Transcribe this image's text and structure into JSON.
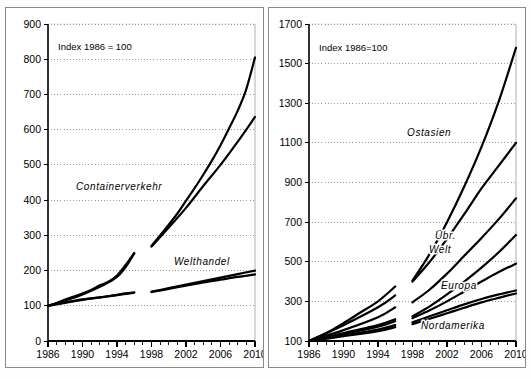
{
  "figure": {
    "panels": [
      {
        "id": "left",
        "annotation": "Index 1986 = 100",
        "series_labels": [
          "Containerverkehr",
          "Welthandel"
        ]
      },
      {
        "id": "right",
        "annotation": "Index 1986=100",
        "series_labels": [
          "Ostasien",
          "Übr.",
          "Welt",
          "Europa",
          "Nordamerika"
        ]
      }
    ]
  },
  "chart_data": [
    {
      "type": "line",
      "title": "",
      "subtitle": "",
      "annotation": "Index 1986 = 100",
      "xlabel": "",
      "ylabel": "",
      "xlim": [
        1986,
        2010
      ],
      "ylim": [
        0,
        900
      ],
      "ytick_labels": [
        "0",
        "100",
        "200",
        "300",
        "400",
        "500",
        "600",
        "700",
        "800",
        "900"
      ],
      "yticks": [
        0,
        100,
        200,
        300,
        400,
        500,
        600,
        700,
        800,
        900
      ],
      "xtick_labels": [
        "1986",
        "1990",
        "1994",
        "1998",
        "2002",
        "2006",
        "2010"
      ],
      "xticks": [
        1986,
        1990,
        1994,
        1998,
        2002,
        2006,
        2010
      ],
      "minor_xticks_every": 1,
      "grid": "horizontal-dotted",
      "legend": "inline-labels",
      "note": "Series are split: observed history 1986-1996, forecast 1998-2010, with a gap between 1996 and 1998.",
      "series": [
        {
          "name": "Containerverkehr",
          "segments": [
            {
              "kind": "history",
              "x": [
                1986,
                1987,
                1988,
                1989,
                1990,
                1991,
                1992,
                1993,
                1994,
                1995,
                1996
              ],
              "values": [
                100,
                108,
                118,
                126,
                135,
                145,
                158,
                168,
                186,
                216,
                250
              ]
            },
            {
              "kind": "forecast",
              "x": [
                1998,
                1999,
                2000,
                2001,
                2002,
                2003,
                2004,
                2005,
                2006,
                2007,
                2008,
                2009,
                2010
              ],
              "values": [
                270,
                300,
                330,
                362,
                398,
                434,
                472,
                512,
                556,
                604,
                654,
                716,
                805
              ]
            }
          ]
        },
        {
          "name": "Containerverkehr-lower",
          "segments": [
            {
              "kind": "history",
              "x": [
                1986,
                1990,
                1994,
                1996
              ],
              "values": [
                100,
                132,
                182,
                248
              ]
            },
            {
              "kind": "forecast",
              "x": [
                1998,
                2000,
                2002,
                2004,
                2006,
                2008,
                2010
              ],
              "values": [
                268,
                322,
                378,
                440,
                500,
                566,
                636
              ]
            }
          ]
        },
        {
          "name": "Welthandel",
          "segments": [
            {
              "kind": "history",
              "x": [
                1986,
                1987,
                1988,
                1989,
                1990,
                1991,
                1992,
                1993,
                1994,
                1995,
                1996
              ],
              "values": [
                100,
                105,
                110,
                114,
                118,
                121,
                124,
                127,
                131,
                135,
                138
              ]
            },
            {
              "kind": "forecast",
              "x": [
                1998,
                2000,
                2002,
                2004,
                2006,
                2008,
                2010
              ],
              "values": [
                140,
                150,
                160,
                170,
                180,
                190,
                200
              ]
            }
          ]
        },
        {
          "name": "Welthandel-lower",
          "segments": [
            {
              "kind": "history",
              "x": [
                1986,
                1990,
                1994,
                1996
              ],
              "values": [
                100,
                117,
                130,
                137
              ]
            },
            {
              "kind": "forecast",
              "x": [
                1998,
                2000,
                2002,
                2004,
                2006,
                2008,
                2010
              ],
              "values": [
                139,
                148,
                157,
                166,
                174,
                182,
                189
              ]
            }
          ]
        }
      ]
    },
    {
      "type": "line",
      "title": "",
      "subtitle": "",
      "annotation": "Index 1986=100",
      "xlabel": "",
      "ylabel": "",
      "xlim": [
        1986,
        2010
      ],
      "ylim": [
        100,
        1700
      ],
      "ytick_labels": [
        "100",
        "300",
        "500",
        "700",
        "900",
        "1100",
        "1300",
        "1500",
        "1700"
      ],
      "yticks": [
        100,
        300,
        500,
        700,
        900,
        1100,
        1300,
        1500,
        1700
      ],
      "xtick_labels": [
        "1986",
        "1990",
        "1994",
        "1998",
        "2002",
        "2006",
        "2010"
      ],
      "xticks": [
        1986,
        1990,
        1994,
        1998,
        2002,
        2006,
        2010
      ],
      "minor_xticks_every": 1,
      "grid": "horizontal-dotted",
      "legend": "inline-labels",
      "note": "Container traffic by region; history 1986-1996 then forecast 1998-2010 with a gap.",
      "series": [
        {
          "name": "Ostasien",
          "segments": [
            {
              "kind": "history",
              "x": [
                1986,
                1988,
                1990,
                1992,
                1994,
                1996
              ],
              "values": [
                100,
                140,
                190,
                245,
                300,
                375
              ]
            },
            {
              "kind": "forecast",
              "x": [
                1998,
                2000,
                2002,
                2004,
                2006,
                2008,
                2010
              ],
              "values": [
                405,
                540,
                700,
                880,
                1080,
                1310,
                1580
              ]
            }
          ]
        },
        {
          "name": "Ostasien-lower",
          "segments": [
            {
              "kind": "history",
              "x": [
                1986,
                1990,
                1994,
                1996
              ],
              "values": [
                100,
                180,
                270,
                330
              ]
            },
            {
              "kind": "forecast",
              "x": [
                1998,
                2000,
                2002,
                2004,
                2006,
                2008,
                2010
              ],
              "values": [
                400,
                500,
                615,
                740,
                870,
                985,
                1100
              ]
            }
          ]
        },
        {
          "name": "Übr. Welt",
          "segments": [
            {
              "kind": "history",
              "x": [
                1986,
                1990,
                1994,
                1996
              ],
              "values": [
                100,
                155,
                220,
                270
              ]
            },
            {
              "kind": "forecast",
              "x": [
                1998,
                2000,
                2002,
                2004,
                2006,
                2008,
                2010
              ],
              "values": [
                295,
                360,
                440,
                530,
                620,
                715,
                820
              ]
            }
          ]
        },
        {
          "name": "Europa",
          "segments": [
            {
              "kind": "history",
              "x": [
                1986,
                1990,
                1994,
                1996
              ],
              "values": [
                100,
                140,
                180,
                210
              ]
            },
            {
              "kind": "forecast",
              "x": [
                1998,
                2000,
                2002,
                2004,
                2006,
                2008,
                2010
              ],
              "values": [
                225,
                275,
                335,
                400,
                470,
                548,
                635
              ]
            }
          ]
        },
        {
          "name": "Europa-lower",
          "segments": [
            {
              "kind": "history",
              "x": [
                1986,
                1990,
                1994,
                1996
              ],
              "values": [
                100,
                135,
                172,
                200
              ]
            },
            {
              "kind": "forecast",
              "x": [
                1998,
                2000,
                2002,
                2004,
                2006,
                2008,
                2010
              ],
              "values": [
                215,
                255,
                300,
                350,
                400,
                448,
                490
              ]
            }
          ]
        },
        {
          "name": "Nordamerika",
          "segments": [
            {
              "kind": "history",
              "x": [
                1986,
                1990,
                1994,
                1996
              ],
              "values": [
                100,
                128,
                158,
                180
              ]
            },
            {
              "kind": "forecast",
              "x": [
                1998,
                2000,
                2002,
                2004,
                2006,
                2008,
                2010
              ],
              "values": [
                195,
                225,
                255,
                285,
                312,
                335,
                355
              ]
            }
          ]
        },
        {
          "name": "Nordamerika-lower",
          "segments": [
            {
              "kind": "history",
              "x": [
                1986,
                1990,
                1994,
                1996
              ],
              "values": [
                100,
                124,
                150,
                170
              ]
            },
            {
              "kind": "forecast",
              "x": [
                1998,
                2000,
                2002,
                2004,
                2006,
                2008,
                2010
              ],
              "values": [
                185,
                212,
                240,
                268,
                295,
                318,
                340
              ]
            }
          ]
        }
      ]
    }
  ]
}
